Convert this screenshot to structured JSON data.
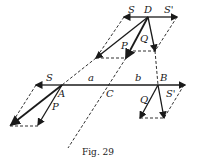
{
  "figure": {
    "caption": "Fig. 29",
    "labels": {
      "S_top": "S",
      "D": "D",
      "S_prime_top": "S'",
      "P_top": "P",
      "Q_top": "Q",
      "S_left": "S",
      "a": "a",
      "b": "b",
      "B": "B",
      "A": "A",
      "C": "C",
      "S_prime_right": "S'",
      "P_left": "P",
      "Q_right": "Q"
    },
    "colors": {
      "ink": "#1a1a1a",
      "background": "#ffffff"
    }
  }
}
